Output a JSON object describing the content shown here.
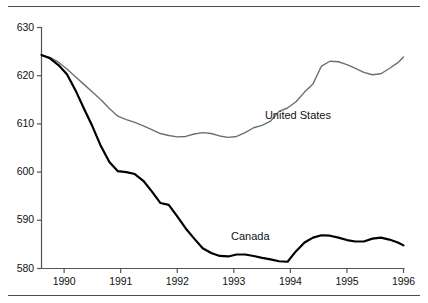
{
  "chart_data": {
    "type": "line",
    "title": "",
    "subtitle": "",
    "xlabel": "",
    "ylabel": "",
    "xlim": [
      1989.6,
      1996.0
    ],
    "ylim": [
      580,
      630
    ],
    "grid": false,
    "legend_position": "inline-annotation",
    "x_ticks": [
      "1990",
      "1991",
      "1992",
      "1993",
      "1994",
      "1995",
      "1996"
    ],
    "x_tick_values": [
      1990,
      1991,
      1992,
      1993,
      1994,
      1995,
      1996
    ],
    "y_ticks": [
      "580",
      "590",
      "600",
      "610",
      "620",
      "630"
    ],
    "y_tick_values": [
      580,
      590,
      600,
      610,
      620,
      630
    ],
    "series": [
      {
        "name": "United States",
        "color": "#6e6e6e",
        "width": 1.4,
        "label_x": 1993.55,
        "label_y": 611.6,
        "x": [
          1989.6,
          1989.75,
          1989.9,
          1990.05,
          1990.2,
          1990.35,
          1990.5,
          1990.65,
          1990.8,
          1990.95,
          1991.1,
          1991.25,
          1991.4,
          1991.55,
          1991.7,
          1991.85,
          1992.0,
          1992.15,
          1992.3,
          1992.45,
          1992.6,
          1992.75,
          1992.9,
          1993.05,
          1993.2,
          1993.35,
          1993.5,
          1993.65,
          1993.8,
          1993.95,
          1994.1,
          1994.25,
          1994.4,
          1994.55,
          1994.7,
          1994.85,
          1995.0,
          1995.15,
          1995.3,
          1995.45,
          1995.6,
          1995.75,
          1995.9,
          1996.0
        ],
        "y": [
          624.2,
          623.8,
          622.8,
          621.4,
          619.8,
          618.2,
          616.6,
          615.0,
          613.2,
          611.6,
          610.9,
          610.3,
          609.6,
          608.8,
          608.0,
          607.6,
          607.3,
          607.4,
          607.9,
          608.2,
          608.0,
          607.5,
          607.2,
          607.4,
          608.2,
          609.2,
          609.7,
          610.6,
          612.6,
          613.3,
          614.6,
          616.6,
          618.3,
          622.0,
          623.0,
          622.9,
          622.3,
          621.5,
          620.7,
          620.2,
          620.4,
          621.5,
          622.7,
          623.9
        ]
      },
      {
        "name": "Canada",
        "color": "#000000",
        "width": 2.2,
        "label_x": 1992.95,
        "label_y": 586.6,
        "x": [
          1989.6,
          1989.75,
          1989.9,
          1990.05,
          1990.2,
          1990.35,
          1990.5,
          1990.65,
          1990.8,
          1990.95,
          1991.1,
          1991.25,
          1991.4,
          1991.55,
          1991.7,
          1991.85,
          1992.0,
          1992.15,
          1992.3,
          1992.45,
          1992.6,
          1992.75,
          1992.9,
          1993.05,
          1993.2,
          1993.35,
          1993.5,
          1993.65,
          1993.8,
          1993.95,
          1994.1,
          1994.25,
          1994.4,
          1994.55,
          1994.7,
          1994.85,
          1995.0,
          1995.15,
          1995.3,
          1995.45,
          1995.6,
          1995.75,
          1995.9,
          1996.0
        ],
        "y": [
          624.3,
          623.6,
          622.2,
          620.3,
          617.0,
          613.2,
          609.5,
          605.4,
          602.1,
          600.2,
          600.0,
          599.6,
          598.2,
          596.0,
          593.6,
          593.2,
          590.8,
          588.3,
          586.2,
          584.2,
          583.2,
          582.6,
          582.5,
          582.9,
          582.9,
          582.6,
          582.2,
          581.9,
          581.5,
          581.4,
          583.6,
          585.4,
          586.4,
          586.9,
          586.8,
          586.4,
          585.9,
          585.6,
          585.6,
          586.2,
          586.4,
          586.0,
          585.4,
          584.8
        ]
      }
    ]
  },
  "axes": {
    "axis_color": "#555555"
  }
}
